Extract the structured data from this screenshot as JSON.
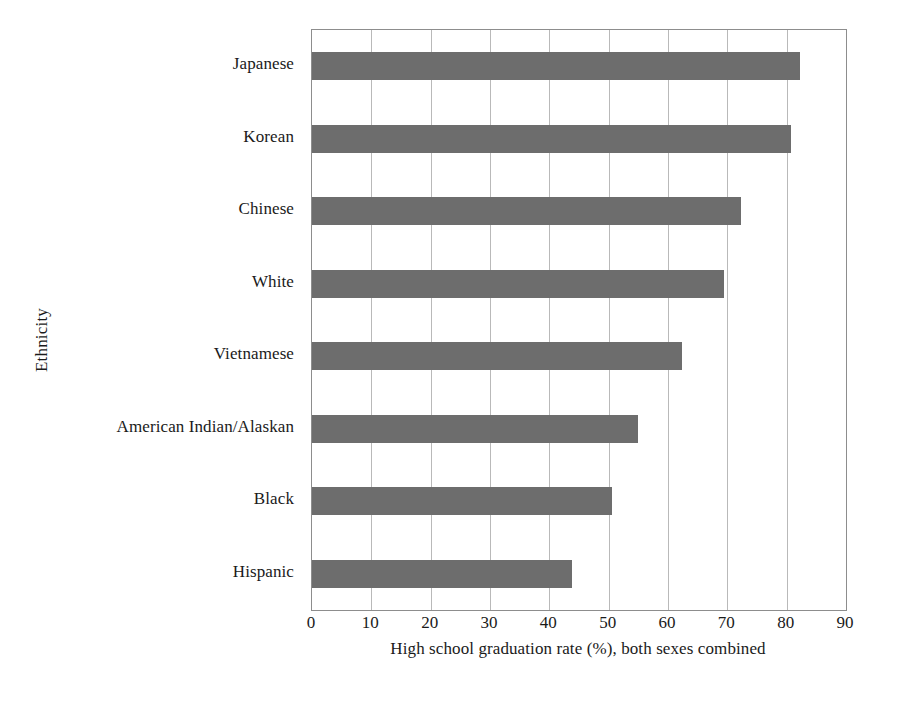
{
  "chart_data": {
    "type": "bar",
    "orientation": "horizontal",
    "title": "",
    "xlabel": "High school graduation rate (%), both sexes combined",
    "ylabel": "Ethnicity",
    "categories": [
      "Japanese",
      "Korean",
      "Chinese",
      "White",
      "Vietnamese",
      "American Indian/Alaskan",
      "Black",
      "Hispanic"
    ],
    "values": [
      82.2,
      80.8,
      72.3,
      69.5,
      62.3,
      54.9,
      50.6,
      43.8
    ],
    "xlim": [
      0,
      90
    ],
    "ylim": [
      0,
      8
    ],
    "xticks": [
      0,
      10,
      20,
      30,
      40,
      50,
      60,
      70,
      80,
      90
    ],
    "xtick_labels": [
      "0",
      "10",
      "20",
      "30",
      "40",
      "50",
      "60",
      "70",
      "80",
      "90"
    ],
    "grid": "vertical",
    "legend": "none",
    "bar_color": "#6d6d6d",
    "gridline_color": "#b9b9b9",
    "frame_color": "#8d8d8d",
    "background_color": "#ffffff"
  }
}
